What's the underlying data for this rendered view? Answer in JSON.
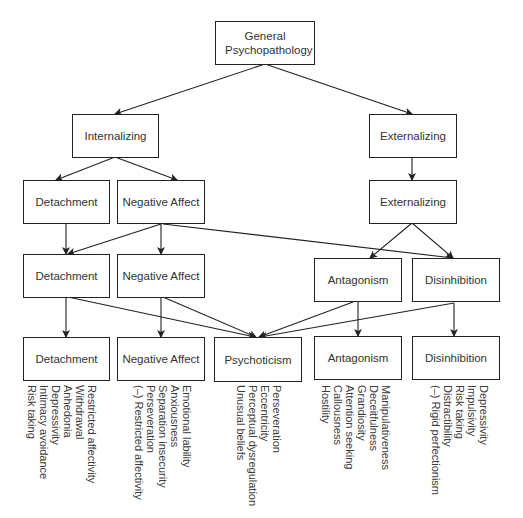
{
  "colors": {
    "line": "#222222",
    "text": "#333333",
    "facet_text": "#3a3a3a",
    "background": "#ffffff"
  },
  "nodes": {
    "general": {
      "label": "General Psychopathology"
    },
    "internalizing": {
      "label": "Internalizing"
    },
    "externalizing_1": {
      "label": "Externalizing"
    },
    "detachment_3": {
      "label": "Detachment"
    },
    "negative_affect_3": {
      "label": "Negative Affect"
    },
    "externalizing_3": {
      "label": "Externalizing"
    },
    "detachment_4": {
      "label": "Detachment"
    },
    "negative_affect_4": {
      "label": "Negative Affect"
    },
    "antagonism_4": {
      "label": "Antagonism"
    },
    "disinhibition_4": {
      "label": "Disinhibition"
    },
    "detachment_5": {
      "label": "Detachment"
    },
    "negative_affect_5": {
      "label": "Negative Affect"
    },
    "psychoticism_5": {
      "label": "Psychoticism"
    },
    "antagonism_5": {
      "label": "Antagonism"
    },
    "disinhibition_5": {
      "label": "Disinhibition"
    }
  },
  "edges": [
    [
      "general",
      "internalizing"
    ],
    [
      "general",
      "externalizing_1"
    ],
    [
      "internalizing",
      "detachment_3"
    ],
    [
      "internalizing",
      "negative_affect_3"
    ],
    [
      "externalizing_1",
      "externalizing_3"
    ],
    [
      "detachment_3",
      "detachment_4"
    ],
    [
      "negative_affect_3",
      "detachment_4"
    ],
    [
      "negative_affect_3",
      "negative_affect_4"
    ],
    [
      "negative_affect_3",
      "disinhibition_4"
    ],
    [
      "externalizing_3",
      "antagonism_4"
    ],
    [
      "externalizing_3",
      "disinhibition_4"
    ],
    [
      "detachment_4",
      "detachment_5"
    ],
    [
      "detachment_4",
      "psychoticism_5"
    ],
    [
      "negative_affect_4",
      "negative_affect_5"
    ],
    [
      "negative_affect_4",
      "psychoticism_5"
    ],
    [
      "antagonism_4",
      "psychoticism_5"
    ],
    [
      "antagonism_4",
      "antagonism_5"
    ],
    [
      "disinhibition_4",
      "psychoticism_5"
    ],
    [
      "disinhibition_4",
      "disinhibition_5"
    ]
  ],
  "facets": {
    "detachment": [
      "Restricted affectivity",
      "Withdrawal",
      "Anhedonia",
      "Depressivity",
      "Intimacy avoidance",
      "Risk taking"
    ],
    "negative_affect": [
      "Emotional lability",
      "Anxiousness",
      "Separation insecurity",
      "Perseveration",
      "(–) Restricted affectivity"
    ],
    "psychoticism": [
      "Perseveration",
      "Eccentricity",
      "Perceptual dysregulation",
      "Unusual beliefs"
    ],
    "antagonism": [
      "Manipulativeness",
      "Deceitfulness",
      "Grandiosity",
      "Attention seeking",
      "Callousness",
      "Hostility"
    ],
    "disinhibition": [
      "Depressivity",
      "Impulsivity",
      "Risk taking",
      "Distractibility",
      "(–) Rigid perfectionism"
    ]
  }
}
